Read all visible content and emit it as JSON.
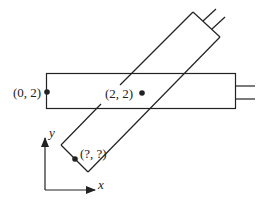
{
  "diagram": {
    "labels": {
      "point_a": "(0, 2)",
      "point_b": "(2, 2)",
      "point_c": "(?, ?)",
      "x_axis": "x",
      "y_axis": "y"
    },
    "colors": {
      "stroke": "#222222",
      "background": "#ffffff"
    },
    "shapes": {
      "horizontal_rect": "rectangle with two leads on right",
      "rotated_rect": "rectangle rotated ~45° with two leads on upper-right end"
    }
  }
}
